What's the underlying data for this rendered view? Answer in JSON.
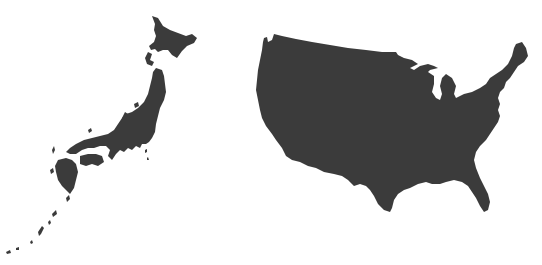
{
  "map": {
    "background_color": "#ffffff",
    "land_color": "#3b3b3b",
    "regions": [
      {
        "id": "japan",
        "label": "Japan",
        "parts": [
          {
            "id": "hokkaido",
            "path": "M152,16 L158,18 L163,26 L170,30 L178,33 L186,36 L192,34 L197,38 L194,43 L187,46 L182,51 L177,58 L172,55 L168,50 L163,50 L158,52 L155,49 L151,50 L149,46 L154,42 L156,36 L154,30 L155,24 Z"
          },
          {
            "id": "oshima-peninsula",
            "path": "M148,52 L152,54 L150,60 L154,62 L152,66 L147,64 L145,58 Z"
          },
          {
            "id": "honshu",
            "path": "M156,68 L162,70 L164,76 L165,84 L166,92 L164,100 L160,108 L158,116 L156,124 L155,132 L152,138 L149,142 L146,144 L142,144 L140,148 L136,146 L132,150 L128,148 L124,152 L120,150 L116,154 L112,160 L108,156 L110,150 L106,146 L100,146 L94,148 L88,148 L82,150 L76,154 L70,154 L66,152 L70,148 L76,144 L84,140 L92,138 L100,136 L108,134 L114,130 L118,124 L122,118 L126,114 L132,112 L138,108 L144,102 L148,94 L150,86 L152,78 L153,72 Z"
          },
          {
            "id": "noto-peninsula",
            "path": "M122,118 L125,112 L128,114 L126,120 Z"
          },
          {
            "id": "shikoku",
            "path": "M80,156 L88,154 L96,154 L102,156 L104,162 L98,166 L92,164 L86,166 L80,164 Z"
          },
          {
            "id": "kyushu",
            "path": "M58,160 L66,158 L72,160 L76,164 L78,172 L76,180 L74,188 L70,194 L66,190 L62,186 L58,180 L56,172 L55,166 Z"
          },
          {
            "id": "tsushima",
            "path": "M52,150 L54,146 L55,150 L53,154 Z"
          },
          {
            "id": "goto",
            "path": "M50,170 L53,168 L54,172 L51,174 Z"
          },
          {
            "id": "sado",
            "path": "M134,104 L138,102 L139,106 L135,108 Z"
          },
          {
            "id": "oki",
            "path": "M88,130 L91,128 L92,131 L89,133 Z"
          },
          {
            "id": "izu-1",
            "path": "M145,150 L147,149 L147,152 L145,153 Z"
          },
          {
            "id": "izu-2",
            "path": "M147,158 L148,157 L149,160 L147,160 Z"
          },
          {
            "id": "tanegashima",
            "path": "M66,198 L69,195 L70,199 L67,202 Z"
          },
          {
            "id": "amami",
            "path": "M52,214 L56,210 L57,214 L53,217 Z"
          },
          {
            "id": "okinawa-1",
            "path": "M48,222 L50,220 L51,223 L49,225 Z"
          },
          {
            "id": "okinawa-2",
            "path": "M38,232 L42,226 L44,228 L41,234 L39,236 Z"
          },
          {
            "id": "miyako",
            "path": "M30,242 L32,240 L33,243 L31,244 Z"
          },
          {
            "id": "yaeyama-1",
            "path": "M16,248 L19,247 L19,250 L16,250 Z"
          },
          {
            "id": "yaeyama-2",
            "path": "M6,252 L10,250 L11,253 L7,254 Z"
          }
        ]
      },
      {
        "id": "usa",
        "label": "United States (contiguous)",
        "parts": [
          {
            "id": "contiguous-us",
            "path": "M264,38 L267,37 L268,42 L272,40 L274,34 L282,36 L296,39 L312,42 L330,45 L348,48 L366,50 L382,52 L396,52 L398,55 L404,58 L412,60 L418,64 L410,68 L414,70 L420,66 L428,64 L434,66 L438,68 L430,70 L428,72 L434,76 L434,84 L432,92 L436,98 L440,100 L442,94 L440,86 L442,78 L446,74 L452,78 L456,86 L454,94 L456,98 L464,94 L472,92 L480,88 L486,84 L490,78 L496,74 L502,70 L508,64 L512,56 L514,48 L516,44 L522,42 L526,48 L528,56 L524,62 L518,66 L514,72 L510,78 L506,82 L504,88 L500,92 L498,98 L500,104 L498,110 L500,116 L498,122 L494,128 L490,134 L486,140 L480,146 L476,152 L474,160 L476,168 L480,178 L484,186 L488,194 L490,202 L488,210 L484,212 L480,206 L476,198 L472,192 L468,186 L462,182 L454,180 L446,182 L440,184 L432,184 L426,182 L418,184 L410,188 L404,190 L398,194 L394,200 L392,208 L390,212 L384,210 L378,204 L374,196 L370,190 L366,186 L360,184 L354,186 L348,180 L342,176 L334,174 L324,172 L316,168 L308,166 L300,162 L292,160 L286,156 L282,148 L276,140 L272,134 L266,126 L262,118 L260,110 L258,100 L256,90 L257,80 L258,70 L260,60 L262,50 L263,42 Z"
          }
        ]
      }
    ]
  }
}
